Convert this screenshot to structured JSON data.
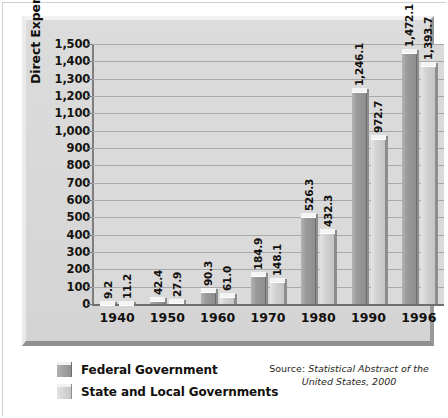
{
  "chart_data": {
    "type": "bar",
    "title": "",
    "xlabel": "",
    "ylabel": "Direct Expenditures (in billions of dollars)",
    "categories": [
      "1940",
      "1950",
      "1960",
      "1970",
      "1980",
      "1990",
      "1996"
    ],
    "series": [
      {
        "name": "Federal Government",
        "color": "#949494",
        "values": [
          9.2,
          42.4,
          90.3,
          184.9,
          526.3,
          1246.1,
          1472.1
        ],
        "labels": [
          "9.2",
          "42.4",
          "90.3",
          "184.9",
          "526.3",
          "1,246.1",
          "1,472.1"
        ]
      },
      {
        "name": "State and Local Governments",
        "color": "#cfcfcf",
        "values": [
          11.2,
          27.9,
          61.0,
          148.1,
          432.3,
          972.7,
          1393.7
        ],
        "labels": [
          "11.2",
          "27.9",
          "61.0",
          "148.1",
          "432.3",
          "972.7",
          "1,393.7"
        ]
      }
    ],
    "ylim": [
      0,
      1500
    ],
    "ytick_step": 100,
    "ytick_labels": [
      "1,500",
      "1,400",
      "1,300",
      "1,200",
      "1,100",
      "1,000",
      "900",
      "800",
      "700",
      "600",
      "500",
      "400",
      "300",
      "200",
      "100",
      "0"
    ],
    "grid": true,
    "legend_position": "bottom-left"
  },
  "legend": {
    "items": [
      {
        "label": "Federal Government",
        "swatch": "federal"
      },
      {
        "label": "State and Local Governments",
        "swatch": "state"
      }
    ]
  },
  "source": {
    "prefix": "Source:",
    "citation": "Statistical Abstract of the United States, 2000"
  }
}
